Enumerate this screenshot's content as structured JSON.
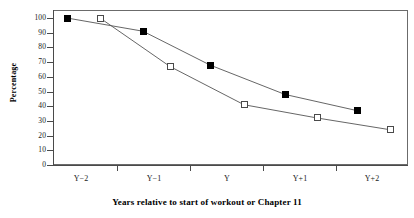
{
  "chart_data": {
    "type": "line",
    "title": "",
    "xlabel": "Years relative to start of workout or Chapter 11",
    "ylabel": "Percentage",
    "categories": [
      "Y−2",
      "Y−1",
      "Y",
      "Y+1",
      "Y+2"
    ],
    "ylim": [
      0,
      100
    ],
    "yticks": [
      0,
      10,
      20,
      30,
      40,
      50,
      60,
      70,
      80,
      90,
      100
    ],
    "ytick_labels": [
      "0",
      "10",
      "20",
      "30",
      "40",
      "50",
      "60",
      "70",
      "80",
      "90",
      "100"
    ],
    "grid": false,
    "legend": "none",
    "series": [
      {
        "name": "filled-square-series",
        "marker": "filled-square",
        "color": "#000000",
        "values": [
          100,
          91,
          68,
          48,
          37
        ],
        "x_px": [
          67,
          143,
          210,
          285,
          357
        ]
      },
      {
        "name": "open-square-series",
        "marker": "open-square",
        "color": "#ffffff",
        "values": [
          100,
          67,
          41,
          32,
          24
        ],
        "x_px": [
          100,
          170,
          244,
          317,
          390
        ]
      }
    ],
    "xtick_px": [
      117,
      190,
      263,
      336
    ],
    "xlabel_px": [
      81,
      154,
      227,
      300,
      372
    ],
    "axis_color": "#4a4a4a",
    "frame_color": "#6b6b6b"
  }
}
